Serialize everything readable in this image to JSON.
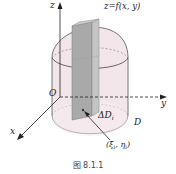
{
  "figure": {
    "caption": "图 8.1.1",
    "surface_label": "z=f(x, y)",
    "axes": {
      "x": "x",
      "y": "y",
      "z": "z",
      "origin": "O"
    },
    "region_label": "D",
    "element_label": "ΔD",
    "element_subscript": "i",
    "point_label": "(ξ",
    "point_sub1": "i",
    "point_mid": ", η",
    "point_sub2": "i",
    "point_close": ")"
  },
  "colors": {
    "solid_fill": "#f3e6ea",
    "column_fill": "#b8b8b8",
    "line": "#333333",
    "dash": "#555555"
  }
}
